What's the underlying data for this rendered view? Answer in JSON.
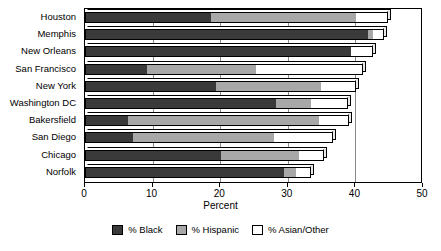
{
  "chart_data": {
    "type": "bar",
    "orientation": "horizontal",
    "stacked": true,
    "title": "",
    "xlabel": "Percent",
    "ylabel": "",
    "xlim": [
      0,
      50
    ],
    "xticks": [
      0,
      10,
      20,
      30,
      40,
      50
    ],
    "xticklabels": [
      "0",
      "10",
      "20",
      "30",
      "40",
      "50"
    ],
    "grid": true,
    "legend_position": "bottom",
    "categories": [
      "Houston",
      "Memphis",
      "New Orleans",
      "San Francisco",
      "New York",
      "Washington DC",
      "Bakersfield",
      "San Diego",
      "Chicago",
      "Norfolk"
    ],
    "series": [
      {
        "name": "% Black",
        "color": "#3a3a3a",
        "values": [
          18.6,
          41.9,
          39.3,
          9.2,
          19.4,
          28.3,
          6.4,
          7.1,
          20.1,
          29.4
        ]
      },
      {
        "name": "% Hispanic",
        "color": "#a8a8a8",
        "values": [
          21.5,
          0.7,
          0.0,
          16.1,
          15.5,
          5.1,
          28.2,
          20.9,
          11.6,
          1.8
        ]
      },
      {
        "name": "% Asian/Other",
        "color": "#ffffff",
        "values": [
          4.7,
          1.6,
          3.3,
          15.8,
          5.2,
          5.5,
          4.5,
          8.7,
          3.7,
          2.2
        ]
      }
    ],
    "totals": [
      44.8,
      44.2,
      42.6,
      41.1,
      40.1,
      38.9,
      39.1,
      36.7,
      35.4,
      33.4
    ]
  },
  "legend": {
    "entries": [
      {
        "label": "% Black",
        "swatch": "black-swatch"
      },
      {
        "label": "% Hispanic",
        "swatch": "hispanic-swatch"
      },
      {
        "label": "% Asian/Other",
        "swatch": "asian-other-swatch"
      }
    ]
  },
  "axis": {
    "x_title": "Percent"
  }
}
